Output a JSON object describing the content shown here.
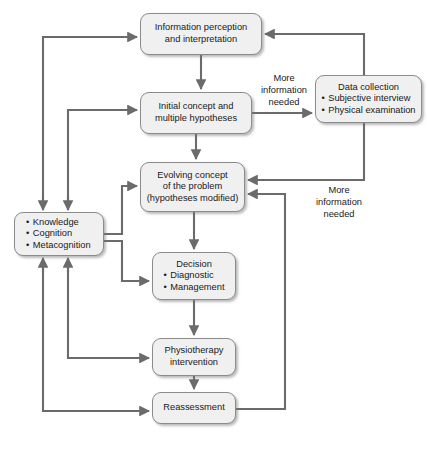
{
  "diagram": {
    "style": {
      "node_fill": "#f0f0f0",
      "node_stroke": "#8b8b8b",
      "wire_color": "#6b6b6b",
      "text_color": "#1a1a1a",
      "background": "#ffffff"
    },
    "nodes": [
      {
        "id": "information-perception",
        "lines": [
          "Information perception",
          "and interpretation"
        ],
        "x": 140,
        "y": 13,
        "w": 122,
        "h": 42
      },
      {
        "id": "initial-concept",
        "lines": [
          "Initial concept and",
          "multiple hypotheses"
        ],
        "x": 140,
        "y": 92,
        "w": 112,
        "h": 42
      },
      {
        "id": "data-collection",
        "heading": "Data collection",
        "bullets": [
          "Subjective interview",
          "Physical examination"
        ],
        "x": 315,
        "y": 75,
        "w": 107,
        "h": 48
      },
      {
        "id": "evolving-concept",
        "lines": [
          "Evolving concept",
          "of the problem",
          "(hypotheses modified)"
        ],
        "x": 140,
        "y": 162,
        "w": 105,
        "h": 50
      },
      {
        "id": "knowledge-cognition",
        "bullets": [
          "Knowledge",
          "Cognition",
          "Metacognition"
        ],
        "x": 14,
        "y": 212,
        "w": 90,
        "h": 44
      },
      {
        "id": "decision",
        "heading": "Decision",
        "bullets": [
          "Diagnostic",
          "Management"
        ],
        "x": 152,
        "y": 252,
        "w": 84,
        "h": 48
      },
      {
        "id": "physiotherapy-intervention",
        "lines": [
          "Physiotherapy",
          "intervention"
        ],
        "x": 152,
        "y": 338,
        "w": 84,
        "h": 38
      },
      {
        "id": "reassessment",
        "lines": [
          "Reassessment"
        ],
        "x": 152,
        "y": 392,
        "w": 84,
        "h": 32
      }
    ],
    "edge_labels": [
      {
        "id": "more-info-needed-top",
        "lines": [
          "More",
          "information",
          "needed"
        ],
        "x": 249,
        "y": 73,
        "w": 70
      },
      {
        "id": "more-info-needed-right",
        "lines": [
          "More",
          "information",
          "needed"
        ],
        "x": 300,
        "y": 185,
        "w": 78
      }
    ]
  }
}
